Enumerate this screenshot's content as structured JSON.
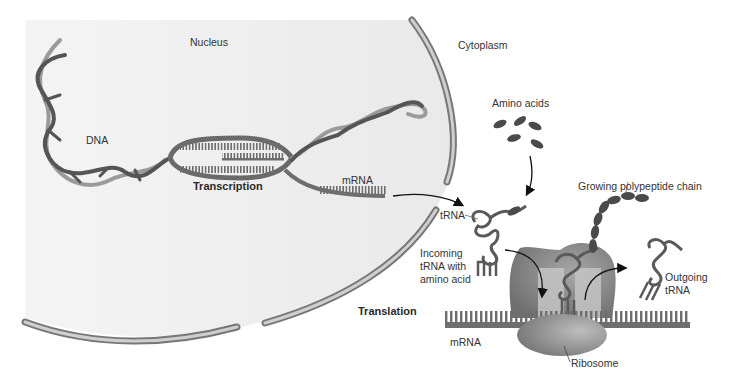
{
  "diagram": {
    "type": "biology-process",
    "regions": {
      "nucleus": "Nucleus",
      "cytoplasm": "Cytoplasm"
    },
    "labels": {
      "dna": "DNA",
      "transcription": "Transcription",
      "mrna_nucleus": "mRNA",
      "amino_acids": "Amino acids",
      "trna": "tRNA",
      "incoming_trna": "Incoming\ntRNA with\namino acid",
      "growing_chain": "Growing polypeptide chain",
      "outgoing_trna": "Outgoing\ntRNA",
      "translation": "Translation",
      "mrna_cytoplasm": "mRNA",
      "ribosome": "Ribosome"
    },
    "colors": {
      "nucleus_fill": "#efefef",
      "envelope_outer": "#7a7a7a",
      "envelope_inner": "#c8c8c8",
      "dna_dark": "#555555",
      "dna_light": "#9a9a9a",
      "mrna": "#6e6e6e",
      "amino_acid": "#4a4a4a",
      "ribosome_large": "#7f7f7f",
      "ribosome_small": "#8a8a8a",
      "ribosome_site": "#c4c4c4"
    },
    "flow": [
      {
        "from": "DNA",
        "to": "mRNA",
        "process": "Transcription",
        "location": "Nucleus"
      },
      {
        "from": "mRNA",
        "to": "Ribosome",
        "process": "export",
        "location": "Cytoplasm"
      },
      {
        "from": "Amino acids",
        "to": "tRNA",
        "process": "charging",
        "location": "Cytoplasm"
      },
      {
        "from": "Incoming tRNA with amino acid",
        "to": "Ribosome",
        "process": "Translation"
      },
      {
        "from": "Ribosome",
        "to": "Outgoing tRNA",
        "process": "release"
      },
      {
        "from": "Ribosome",
        "to": "Growing polypeptide chain",
        "process": "elongation"
      }
    ]
  }
}
